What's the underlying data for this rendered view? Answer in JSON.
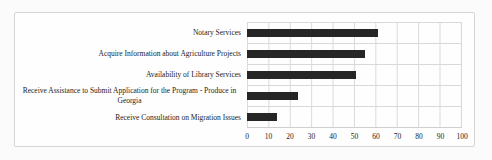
{
  "chart_data": {
    "type": "bar",
    "orientation": "horizontal",
    "title": "",
    "xlabel": "",
    "ylabel": "",
    "categories": [
      "Notary Services",
      "Acquire Information about Agriculture Projects",
      "Availability of Library Services",
      "Receive Assistance to Submit Application for the Program - Produce in Georgia",
      "Receive Consultation on Migration Issues"
    ],
    "values": [
      61,
      55,
      51,
      24,
      14
    ],
    "xlim": [
      0,
      100
    ],
    "x_ticks": [
      0,
      10,
      20,
      30,
      40,
      50,
      60,
      70,
      80,
      90,
      100
    ],
    "grid": "both",
    "legend": "none",
    "colors": {
      "bar": "#262626",
      "gridline": "#d9d9d9",
      "axis_line": "#cfcfcf",
      "text": "#1c1c1c",
      "chart_border": "#d4d4d4",
      "background": "#fefefe"
    }
  }
}
